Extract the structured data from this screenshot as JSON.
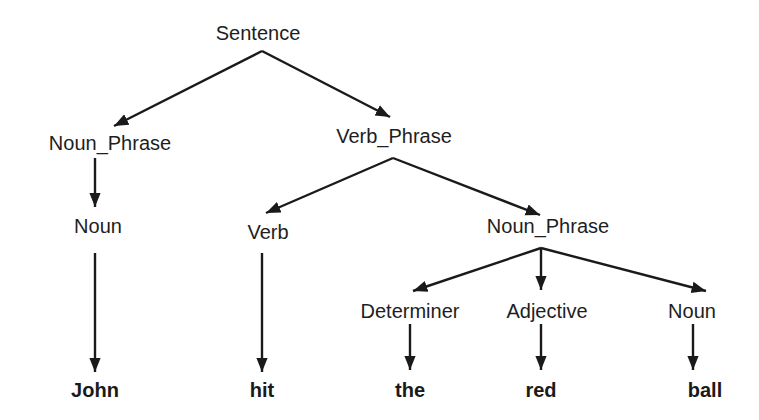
{
  "diagram": {
    "type": "parse-tree",
    "nodes": {
      "sentence": {
        "label": "Sentence",
        "x": 258,
        "y": 33
      },
      "noun_phrase_subject": {
        "label": "Noun_Phrase",
        "x": 110,
        "y": 143
      },
      "verb_phrase": {
        "label": "Verb_Phrase",
        "x": 394,
        "y": 136
      },
      "noun_subject": {
        "label": "Noun",
        "x": 98,
        "y": 226
      },
      "verb": {
        "label": "Verb",
        "x": 268,
        "y": 232
      },
      "noun_phrase_object": {
        "label": "Noun_Phrase",
        "x": 548,
        "y": 226
      },
      "determiner": {
        "label": "Determiner",
        "x": 410,
        "y": 311
      },
      "adjective": {
        "label": "Adjective",
        "x": 547,
        "y": 311
      },
      "noun_object": {
        "label": "Noun",
        "x": 692,
        "y": 311
      },
      "leaf_john": {
        "label": "John",
        "x": 95,
        "y": 390
      },
      "leaf_hit": {
        "label": "hit",
        "x": 262,
        "y": 390
      },
      "leaf_the": {
        "label": "the",
        "x": 410,
        "y": 390
      },
      "leaf_red": {
        "label": "red",
        "x": 541,
        "y": 390
      },
      "leaf_ball": {
        "label": "ball",
        "x": 705,
        "y": 390
      }
    },
    "edges": [
      {
        "from": "sentence",
        "to": "noun_phrase_subject"
      },
      {
        "from": "sentence",
        "to": "verb_phrase"
      },
      {
        "from": "noun_phrase_subject",
        "to": "noun_subject"
      },
      {
        "from": "verb_phrase",
        "to": "verb"
      },
      {
        "from": "verb_phrase",
        "to": "noun_phrase_object"
      },
      {
        "from": "noun_subject",
        "to": "leaf_john"
      },
      {
        "from": "verb",
        "to": "leaf_hit"
      },
      {
        "from": "noun_phrase_object",
        "to": "determiner"
      },
      {
        "from": "noun_phrase_object",
        "to": "adjective"
      },
      {
        "from": "noun_phrase_object",
        "to": "noun_object"
      },
      {
        "from": "determiner",
        "to": "leaf_the"
      },
      {
        "from": "adjective",
        "to": "leaf_red"
      },
      {
        "from": "noun_object",
        "to": "leaf_ball"
      }
    ],
    "colors": {
      "line": "#1a1a1a",
      "text": "#1e1e1e",
      "background": "#ffffff"
    }
  }
}
